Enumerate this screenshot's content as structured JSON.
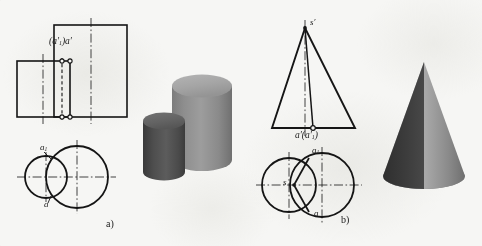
{
  "figure": {
    "background_color": "#f6f6f4",
    "line_color": "#151515",
    "panels": [
      {
        "id": "a",
        "caption": "a)",
        "caption_pos": {
          "x": 106,
          "y": 219
        },
        "solid": "cylinder-pair",
        "front_view_label": "(a'₁)a'",
        "top_view_labels": [
          "a₁",
          "a"
        ]
      },
      {
        "id": "b",
        "caption": "b)",
        "caption_pos": {
          "x": 341,
          "y": 215
        },
        "solid": "cone",
        "apex_label": "s'",
        "front_view_label": "a'(a'₁)",
        "top_view_labels": [
          "a₁",
          "a",
          "s"
        ]
      }
    ]
  },
  "labels": {
    "panel_a": {
      "front_projection": {
        "main": "(a",
        "prime1": "′",
        "sub1": "1",
        "close": ")a",
        "prime2": "′"
      },
      "front_projection_text": "(a′1)a′",
      "top_a1": "a",
      "top_a1_sub": "1",
      "top_a": "a"
    },
    "panel_b": {
      "apex": "s",
      "apex_prime": "′",
      "front_projection_text": "a′(a′1)",
      "top_a1": "a",
      "top_a1_sub": "1",
      "top_a": "a",
      "top_s": "s"
    },
    "caption_a": "a)",
    "caption_b": "b)"
  },
  "geometry": {
    "panel_a": {
      "tall_rect": {
        "x": 54,
        "y": 25,
        "w": 73,
        "h": 92
      },
      "short_rect": {
        "x": 17,
        "y": 61,
        "w": 53,
        "h": 56
      },
      "center_line_tall_x": 91,
      "center_line_short_x": 43,
      "hidden_line_x": 62,
      "circle_large": {
        "cx": 77,
        "cy": 177,
        "r": 31
      },
      "circle_small": {
        "cx": 46,
        "cy": 177,
        "r": 21
      }
    },
    "panel_b": {
      "triangle": {
        "apex_x": 305,
        "apex_y": 28,
        "base_y": 128,
        "base_left_x": 272,
        "base_right_x": 355
      },
      "inner_line_base_x": 313,
      "circle_left": {
        "cx": 289,
        "cy": 185,
        "r": 27
      },
      "circle_right": {
        "cx": 322,
        "cy": 185,
        "r": 32
      },
      "wedge_point": {
        "x": 294,
        "y": 185
      }
    }
  },
  "shading": {
    "cylinder_back": {
      "top": "#a9a9a9",
      "body_light": "#9b9b9b",
      "body_dark": "#6f6f6f"
    },
    "cylinder_front": {
      "top": "#6a6a6a",
      "body_light": "#636363",
      "body_dark": "#3c3c3c"
    },
    "cone": {
      "left": "#3b3b3b",
      "right_light": "#b4b4b4",
      "right_dark": "#7a7a7a"
    }
  }
}
